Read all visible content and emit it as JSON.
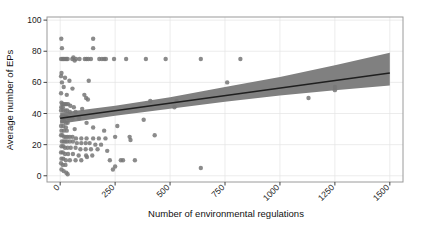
{
  "chart_data": {
    "type": "scatter",
    "title": "",
    "xlabel": "Number of environmental regulations",
    "ylabel": "Average number of EPs",
    "xlim": [
      -60,
      1560
    ],
    "ylim": [
      -4,
      102
    ],
    "xticks": [
      0,
      250,
      500,
      750,
      1000,
      1250,
      1500
    ],
    "xticklabels": [
      "0",
      "250",
      "500",
      "750",
      "1000",
      "1250",
      "1500"
    ],
    "yticks": [
      0,
      20,
      40,
      60,
      80,
      100
    ],
    "yticklabels": [
      "0",
      "20",
      "40",
      "60",
      "80",
      "100"
    ],
    "xtick_label_rotation": 45,
    "grid": true,
    "legend": false,
    "point_color": "#777777",
    "point_radius": 2.2,
    "band_color": "#808080",
    "line_color": "#1f1f1f",
    "grid_color": "#e4e4e4",
    "frame_color": "#9a9a9a",
    "background": "#ffffff",
    "fit_line": {
      "name": "linear fit",
      "x": [
        0,
        1500
      ],
      "y": [
        37.0,
        66.0
      ]
    },
    "confidence_band": {
      "name": "95% confidence interval",
      "x": [
        0,
        250,
        500,
        750,
        1000,
        1250,
        1500
      ],
      "upper": [
        40.5,
        45.0,
        50.5,
        57.0,
        63.5,
        71.0,
        79.0
      ],
      "lower": [
        33.5,
        38.5,
        43.0,
        47.5,
        51.5,
        55.0,
        58.0
      ]
    },
    "points": [
      [
        5,
        88
      ],
      [
        8,
        82
      ],
      [
        150,
        88
      ],
      [
        150,
        82
      ],
      [
        4,
        75
      ],
      [
        10,
        75
      ],
      [
        16,
        75
      ],
      [
        22,
        75
      ],
      [
        28,
        75
      ],
      [
        34,
        75
      ],
      [
        55,
        75
      ],
      [
        60,
        76
      ],
      [
        66,
        74
      ],
      [
        72,
        75
      ],
      [
        88,
        75
      ],
      [
        112,
        75
      ],
      [
        120,
        75
      ],
      [
        128,
        75
      ],
      [
        140,
        75
      ],
      [
        178,
        75
      ],
      [
        190,
        75
      ],
      [
        200,
        75
      ],
      [
        208,
        75
      ],
      [
        245,
        75
      ],
      [
        300,
        75
      ],
      [
        390,
        75
      ],
      [
        480,
        75
      ],
      [
        640,
        75
      ],
      [
        820,
        75
      ],
      [
        6,
        66
      ],
      [
        4,
        64
      ],
      [
        22,
        63
      ],
      [
        42,
        61
      ],
      [
        8,
        60
      ],
      [
        130,
        61
      ],
      [
        760,
        60
      ],
      [
        16,
        57
      ],
      [
        56,
        56
      ],
      [
        1250,
        57
      ],
      [
        4,
        53
      ],
      [
        30,
        52
      ],
      [
        110,
        52
      ],
      [
        118,
        50
      ],
      [
        126,
        49
      ],
      [
        6,
        47
      ],
      [
        10,
        46
      ],
      [
        16,
        46
      ],
      [
        22,
        46
      ],
      [
        28,
        46
      ],
      [
        36,
        46
      ],
      [
        46,
        45
      ],
      [
        5,
        44
      ],
      [
        12,
        44
      ],
      [
        62,
        44
      ],
      [
        100,
        43
      ],
      [
        410,
        48
      ],
      [
        530,
        48
      ],
      [
        4,
        42
      ],
      [
        14,
        42
      ],
      [
        24,
        42
      ],
      [
        32,
        42
      ],
      [
        44,
        41
      ],
      [
        70,
        41
      ],
      [
        1130,
        50
      ],
      [
        1250,
        55
      ],
      [
        6,
        38
      ],
      [
        12,
        38
      ],
      [
        20,
        38
      ],
      [
        28,
        38
      ],
      [
        38,
        37
      ],
      [
        56,
        37
      ],
      [
        86,
        37
      ],
      [
        10,
        35
      ],
      [
        18,
        35
      ],
      [
        26,
        34
      ],
      [
        34,
        34
      ],
      [
        120,
        34
      ],
      [
        520,
        44
      ],
      [
        4,
        32
      ],
      [
        14,
        32
      ],
      [
        26,
        31
      ],
      [
        150,
        31
      ],
      [
        260,
        32
      ],
      [
        6,
        29
      ],
      [
        16,
        29
      ],
      [
        30,
        29
      ],
      [
        66,
        30
      ],
      [
        200,
        29
      ],
      [
        380,
        36
      ],
      [
        4,
        26
      ],
      [
        10,
        26
      ],
      [
        18,
        25
      ],
      [
        26,
        25
      ],
      [
        34,
        25
      ],
      [
        44,
        25
      ],
      [
        56,
        25
      ],
      [
        72,
        24
      ],
      [
        96,
        24
      ],
      [
        120,
        24
      ],
      [
        150,
        24
      ],
      [
        176,
        24
      ],
      [
        206,
        24
      ],
      [
        250,
        25
      ],
      [
        316,
        25
      ],
      [
        320,
        23
      ],
      [
        430,
        26
      ],
      [
        8,
        22
      ],
      [
        16,
        22
      ],
      [
        24,
        22
      ],
      [
        32,
        22
      ],
      [
        44,
        22
      ],
      [
        58,
        22
      ],
      [
        76,
        21
      ],
      [
        96,
        21
      ],
      [
        116,
        21
      ],
      [
        134,
        21
      ],
      [
        160,
        20
      ],
      [
        186,
        20
      ],
      [
        6,
        19
      ],
      [
        14,
        19
      ],
      [
        22,
        18
      ],
      [
        34,
        18
      ],
      [
        48,
        18
      ],
      [
        70,
        18
      ],
      [
        92,
        17
      ],
      [
        116,
        17
      ],
      [
        140,
        17
      ],
      [
        170,
        17
      ],
      [
        214,
        16
      ],
      [
        4,
        15
      ],
      [
        12,
        15
      ],
      [
        22,
        14
      ],
      [
        36,
        14
      ],
      [
        58,
        14
      ],
      [
        84,
        13
      ],
      [
        118,
        13
      ],
      [
        146,
        13
      ],
      [
        122,
        12
      ],
      [
        6,
        11
      ],
      [
        14,
        11
      ],
      [
        26,
        10
      ],
      [
        44,
        10
      ],
      [
        70,
        10
      ],
      [
        96,
        10
      ],
      [
        226,
        10
      ],
      [
        276,
        10
      ],
      [
        286,
        10
      ],
      [
        340,
        10
      ],
      [
        4,
        8
      ],
      [
        12,
        7
      ],
      [
        24,
        7
      ],
      [
        250,
        6
      ],
      [
        640,
        5
      ],
      [
        6,
        4
      ],
      [
        16,
        3
      ],
      [
        28,
        2
      ],
      [
        240,
        4
      ],
      [
        34,
        1
      ]
    ]
  }
}
